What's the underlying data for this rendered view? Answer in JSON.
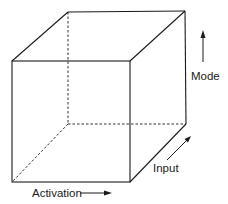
{
  "diagram": {
    "type": "3d-cube",
    "axes": [
      {
        "id": "activation",
        "label": "Activation",
        "direction": "right"
      },
      {
        "id": "input",
        "label": "Input",
        "direction": "depth (diagonal up-right)"
      },
      {
        "id": "mode",
        "label": "Mode",
        "direction": "up"
      }
    ],
    "colors": {
      "line": "#1a1a1a",
      "background": "#ffffff"
    }
  }
}
